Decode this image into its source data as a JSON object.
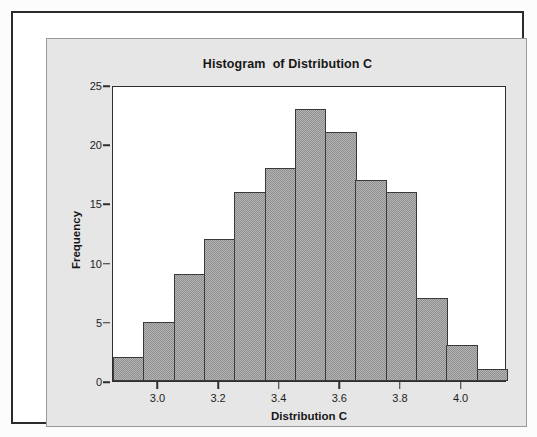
{
  "chart_data": {
    "type": "bar",
    "title": "Histogram  of Distribution C",
    "xlabel": "Distribution C",
    "ylabel": "Frequency",
    "grid": false,
    "legend": false,
    "xlim": [
      2.85,
      4.15
    ],
    "ylim": [
      0,
      25
    ],
    "bin_width": 0.1,
    "xticks": [
      "3.0",
      "3.2",
      "3.4",
      "3.6",
      "3.8",
      "4.0"
    ],
    "xtick_values": [
      3.0,
      3.2,
      3.4,
      3.6,
      3.8,
      4.0
    ],
    "yticks": [
      "0",
      "5",
      "10",
      "15",
      "20",
      "25"
    ],
    "ytick_values": [
      0,
      5,
      10,
      15,
      20,
      25
    ],
    "bin_starts": [
      2.85,
      2.95,
      3.05,
      3.15,
      3.25,
      3.35,
      3.45,
      3.55,
      3.65,
      3.75,
      3.85,
      3.95,
      4.05
    ],
    "bin_centers": [
      2.9,
      3.0,
      3.1,
      3.2,
      3.3,
      3.4,
      3.5,
      3.6,
      3.7,
      3.8,
      3.9,
      4.0,
      4.1
    ],
    "categories": [
      "2.85-2.95",
      "2.95-3.05",
      "3.05-3.15",
      "3.15-3.25",
      "3.25-3.35",
      "3.35-3.45",
      "3.45-3.55",
      "3.55-3.65",
      "3.65-3.75",
      "3.75-3.85",
      "3.85-3.95",
      "3.95-4.05",
      "4.05-4.15"
    ],
    "values": [
      2,
      5,
      9,
      12,
      16,
      18,
      23,
      21,
      17,
      16,
      7,
      3,
      1
    ],
    "total_count": 150,
    "bar_fill_color": "#b4b4b4",
    "bar_edge_color": "#3a3a3a",
    "panel_color": "#e6e6e6",
    "plot_bg_color": "#ffffff",
    "frame_color": "#2b2b2b"
  }
}
